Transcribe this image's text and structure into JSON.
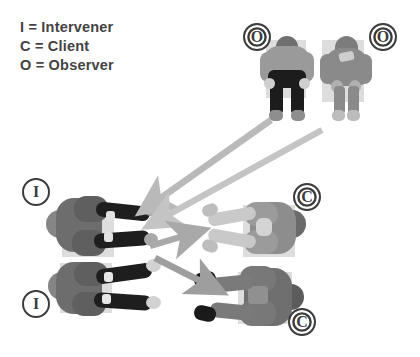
{
  "diagram": {
    "background_color": "#ffffff"
  },
  "legend": {
    "items": [
      {
        "key": "I",
        "separator": "=",
        "label": "Intervener",
        "text": "I = Intervener"
      },
      {
        "key": "C",
        "separator": "=",
        "label": "Client",
        "text": "C = Client"
      },
      {
        "key": "O",
        "separator": "=",
        "label": "Observer",
        "text": "O = Observer"
      }
    ],
    "text_color": "#434343"
  },
  "markers": [
    {
      "id": "observer-left",
      "letter": "O",
      "role": "Observer",
      "x": 243,
      "y": 23,
      "style": "ring"
    },
    {
      "id": "observer-right",
      "letter": "O",
      "role": "Observer",
      "x": 369,
      "y": 23,
      "style": "ring"
    },
    {
      "id": "intervener-top",
      "letter": "I",
      "role": "Intervener",
      "x": 22,
      "y": 178,
      "style": "plain"
    },
    {
      "id": "intervener-bottom",
      "letter": "I",
      "role": "Intervener",
      "x": 22,
      "y": 290,
      "style": "plain"
    },
    {
      "id": "client-top",
      "letter": "C",
      "role": "Client",
      "x": 293,
      "y": 183,
      "style": "ring"
    },
    {
      "id": "client-bottom",
      "letter": "C",
      "role": "Client",
      "x": 288,
      "y": 308,
      "style": "ring"
    }
  ],
  "figures": [
    {
      "id": "observer-figure-left",
      "role": "Observer",
      "orientation": "top-down-standing",
      "palette": {
        "body": "#9a9a9a",
        "head": "#6f6f6f",
        "legs": "#1c1c1c",
        "shoes": "#8e8e8e"
      }
    },
    {
      "id": "observer-figure-right",
      "role": "Observer",
      "orientation": "top-down-standing",
      "palette": {
        "body": "#8a8a8a",
        "head": "#7c7c7c",
        "legs": "#8a8a8a",
        "shoes": "#bcbcbc"
      }
    },
    {
      "id": "intervener-figure-top",
      "role": "Intervener",
      "orientation": "top-down-lying",
      "palette": {
        "body": "#6d6d6d",
        "head": "#646464",
        "arms": "#1e1e1e",
        "hands": "#a8a8a8"
      }
    },
    {
      "id": "intervener-figure-bottom",
      "role": "Intervener",
      "orientation": "top-down-lying",
      "palette": {
        "body": "#6d6d6d",
        "head": "#646464",
        "arms": "#1e1e1e",
        "hands": "#d2d2d2"
      }
    },
    {
      "id": "client-figure-top",
      "role": "Client",
      "orientation": "top-down-lying",
      "palette": {
        "body": "#8d8d8d",
        "head": "#6a6a6a",
        "arms": "#c9c9c9",
        "hands": "#bdbdbd"
      }
    },
    {
      "id": "client-figure-bottom",
      "role": "Client",
      "orientation": "top-down-lying",
      "palette": {
        "body": "#6f6f6f",
        "head": "#5c5c5c",
        "arms": "#7a7a7a",
        "hands": "#1a1a1a"
      }
    }
  ],
  "arrows": [
    {
      "id": "arrow-observer-left-to-intervener",
      "from": "observer-left",
      "to": "intervener-top",
      "color": "#b9b9b9"
    },
    {
      "id": "arrow-observer-right-to-intervener",
      "from": "observer-right",
      "to": "intervener-top",
      "color": "#c4c4c4"
    },
    {
      "id": "arrow-intervener-to-client-top",
      "from": "intervener-top",
      "to": "client-top",
      "color": "#a9a9a9"
    },
    {
      "id": "arrow-intervener-to-client-bottom",
      "from": "intervener-top",
      "to": "client-bottom",
      "color": "#9e9e9e"
    }
  ]
}
